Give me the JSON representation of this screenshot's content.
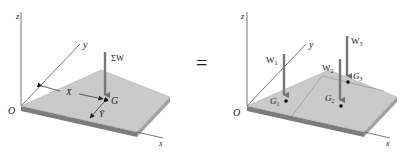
{
  "colors": {
    "plate_top": "#c8c8c8",
    "plate_top_light": "#d4d4d4",
    "plate_edge": "#8e8e8e",
    "plate_edge_dark": "#6e6e6e",
    "arrow": "#7a7a7a",
    "axis": "#555555",
    "text": "#222222"
  },
  "left_figure": {
    "axis_z": "z",
    "axis_y": "y",
    "axis_x": "x",
    "origin": "O",
    "force_label": "ΣW",
    "centroid_label": "G",
    "xbar_label": "X̄",
    "ybar_label": "Ȳ"
  },
  "equals_sign": "=",
  "right_figure": {
    "axis_z": "z",
    "axis_y": "y",
    "axis_x": "x",
    "origin": "O",
    "forces": [
      {
        "label": "W",
        "sub": "1"
      },
      {
        "label": "W",
        "sub": "2"
      },
      {
        "label": "W",
        "sub": "3"
      }
    ],
    "centroids": [
      {
        "label": "G",
        "sub": "1"
      },
      {
        "label": "G",
        "sub": "2"
      },
      {
        "label": "G",
        "sub": "3"
      }
    ]
  }
}
